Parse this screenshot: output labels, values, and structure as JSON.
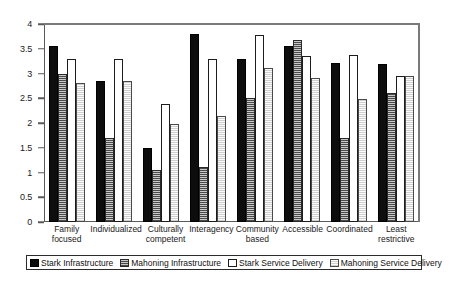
{
  "chart_data": {
    "type": "bar",
    "title": "",
    "xlabel": "",
    "ylabel": "",
    "ylim": [
      0,
      4
    ],
    "yticks": [
      "0",
      "0.5",
      "1",
      "1.5",
      "2",
      "2.5",
      "3",
      "3.5",
      "4"
    ],
    "ytick_values": [
      0,
      0.5,
      1,
      1.5,
      2,
      2.5,
      3,
      3.5,
      4
    ],
    "grid": false,
    "legend_position": "bottom",
    "categories": [
      "Family focused",
      "Individualized",
      "Culturally competent",
      "Interagency",
      "Community based",
      "Accessible",
      "Coordinated",
      "Least restrictive"
    ],
    "series": [
      {
        "name": "Stark Infrastructure",
        "color": "#0d0d0d",
        "pattern": "solid-black",
        "values": [
          3.55,
          2.85,
          1.5,
          3.8,
          3.3,
          3.55,
          3.22,
          3.2
        ]
      },
      {
        "name": "Mahoning Infrastructure",
        "color": "#4a4a4a",
        "pattern": "dark-hatch",
        "values": [
          3.0,
          1.7,
          1.05,
          1.12,
          2.5,
          3.68,
          1.7,
          2.6
        ]
      },
      {
        "name": "Stark Service Delivery",
        "color": "#ffffff",
        "pattern": "white",
        "values": [
          3.3,
          3.3,
          2.38,
          3.3,
          3.78,
          3.35,
          3.38,
          2.95
        ]
      },
      {
        "name": "Mahoning Service Delivery",
        "color": "#cfcfcf",
        "pattern": "light-stipple",
        "values": [
          2.8,
          2.85,
          1.98,
          2.15,
          3.12,
          2.9,
          2.48,
          2.95
        ]
      }
    ]
  }
}
